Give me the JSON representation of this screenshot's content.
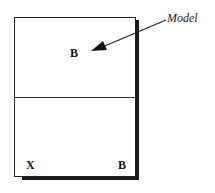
{
  "diagram": {
    "annotation": "Model",
    "top_panel": {
      "label": "B"
    },
    "bottom_panel": {
      "left_label": "X",
      "right_label": "B"
    },
    "colors": {
      "line": "#222222",
      "shadow": "#1a1a1a",
      "background": "#ffffff"
    }
  }
}
